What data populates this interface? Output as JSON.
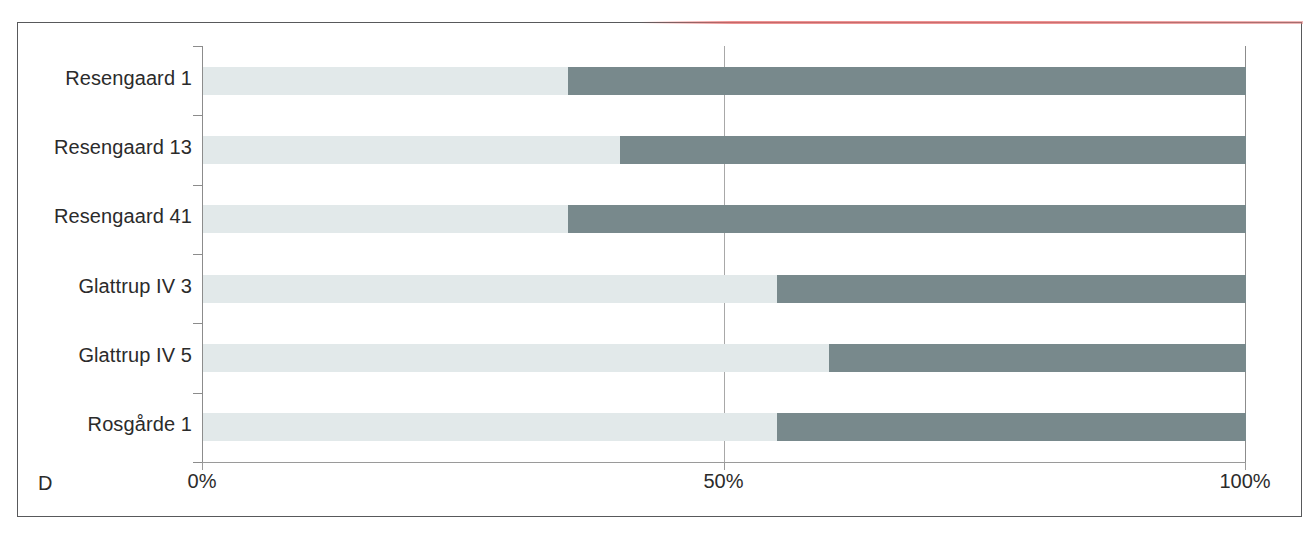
{
  "figure": {
    "panel_letter": "D",
    "accent_colors": {
      "segment_light": "#e2e9ea",
      "segment_dark": "#78898c",
      "frame": "#58595b",
      "axis": "#8c8c8c",
      "gridline": "#a8a8a8",
      "scan_artifact_red": "#e77272"
    }
  },
  "chart_data": {
    "type": "bar",
    "orientation": "horizontal",
    "stacked": true,
    "normalized": true,
    "title": "",
    "subtitle": "",
    "xlabel": "",
    "ylabel": "",
    "xlim": [
      0,
      100
    ],
    "xticks": [
      0,
      50,
      100
    ],
    "xticklabels": [
      "0%",
      "50%",
      "100%"
    ],
    "grid": "vertical-at-50",
    "legend": "none",
    "categories": [
      "Resengaard 1",
      "Resengaard 13",
      "Resengaard 41",
      "Glattrup IV 3",
      "Glattrup IV 5",
      "Rosgårde 1"
    ],
    "series": [
      {
        "name": "light-segment",
        "color": "#e2e9ea",
        "values": [
          35,
          40,
          35,
          55,
          60,
          55
        ]
      },
      {
        "name": "dark-segment",
        "color": "#78898c",
        "values": [
          65,
          60,
          65,
          45,
          40,
          45
        ]
      }
    ]
  }
}
